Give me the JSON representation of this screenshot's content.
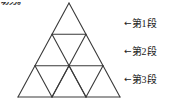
{
  "figure": {
    "corner_note": "切分。",
    "line_color": "#3a3a3a",
    "background_color": "#ffffff",
    "triangle": {
      "apex": {
        "x": 69,
        "y": 3
      },
      "base_left": {
        "x": 18,
        "y": 97
      },
      "base_right": {
        "x": 120,
        "y": 97
      },
      "rows": 3,
      "small_triangles_per_row": [
        1,
        3,
        5
      ],
      "total_small_triangles": 9,
      "row_divider_y": [
        34.3,
        65.7,
        97
      ]
    }
  },
  "labels": [
    {
      "arrow": "←",
      "text": "第1段"
    },
    {
      "arrow": "←",
      "text": "第2段"
    },
    {
      "arrow": "←",
      "text": "第3段"
    }
  ]
}
